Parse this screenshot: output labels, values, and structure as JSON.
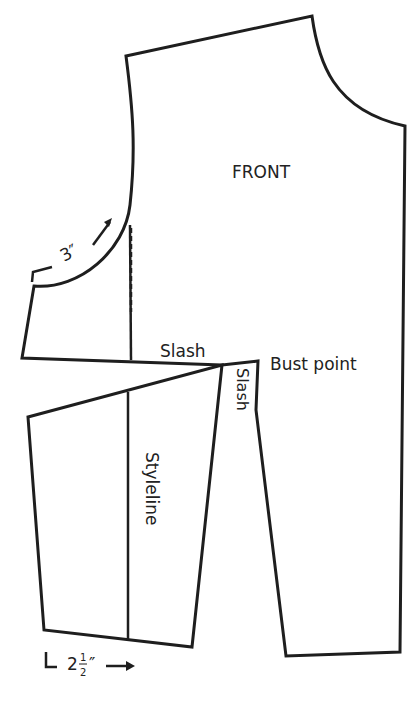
{
  "diagram": {
    "labels": {
      "front": "FRONT",
      "slash_horizontal": "Slash",
      "slash_vertical": "Slash",
      "bust_point": "Bust point",
      "styleline": "Styleline",
      "armhole_measure": "3″",
      "hem_measure_whole": "2",
      "hem_measure_num": "1",
      "hem_measure_den": "2",
      "hem_measure_unit": "″"
    },
    "colors": {
      "stroke": "#1e1e1e",
      "background": "#ffffff"
    }
  }
}
